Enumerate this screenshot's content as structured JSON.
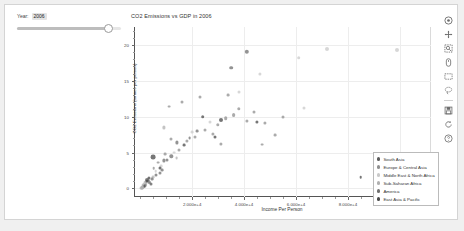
{
  "app": {
    "background": "#f0f0f0",
    "panel_background": "#ffffff"
  },
  "slider": {
    "label_prefix": "Year:",
    "value": "2006",
    "min": 1960,
    "max": 2010,
    "handle_percent": 88,
    "name": "year-slider"
  },
  "plot": {
    "title": "CO2 Emissions vs GDP in 2006",
    "xlabel": "Income Per Person",
    "ylabel": "CO2 Emissions (tonnes per person)"
  },
  "axes": {
    "x_ticks": [
      {
        "label": "2.000e+4",
        "value": 20000
      },
      {
        "label": "4.000e+4",
        "value": 40000
      },
      {
        "label": "6.000e+4",
        "value": 60000
      },
      {
        "label": "8.000e+4",
        "value": 80000
      },
      {
        "label": "1.000e+5",
        "value": 100000
      }
    ],
    "y_ticks": [
      {
        "label": "20",
        "value": 20
      },
      {
        "label": "15",
        "value": 15
      },
      {
        "label": "10",
        "value": 10
      },
      {
        "label": "5",
        "value": 5
      },
      {
        "label": "0",
        "value": 0
      }
    ],
    "xlim": [
      -2000,
      112000
    ],
    "ylim": [
      -1.2,
      22.5
    ],
    "grid": true
  },
  "legend": {
    "position": "bottom-right",
    "items": [
      {
        "label": "South Asia",
        "color": "#5b5b5b"
      },
      {
        "label": "Europe & Central Asia",
        "color": "#8f8f8f"
      },
      {
        "label": "Middle East & North Africa",
        "color": "#c9c9c9"
      },
      {
        "label": "Sub-Saharan Africa",
        "color": "#b0b0b0"
      },
      {
        "label": "America",
        "color": "#6f6f6f"
      },
      {
        "label": "East Asia & Pacific",
        "color": "#484848"
      }
    ]
  },
  "toolbar": {
    "items": [
      {
        "name": "bokeh-logo-icon",
        "label": "Bokeh"
      },
      {
        "name": "pan-tool-icon",
        "label": "Pan"
      },
      {
        "name": "box-zoom-tool-icon",
        "label": "Box Zoom"
      },
      {
        "name": "wheel-zoom-tool-icon",
        "label": "Wheel Zoom"
      },
      {
        "name": "box-select-tool-icon",
        "label": "Box Select"
      },
      {
        "name": "lasso-select-tool-icon",
        "label": "Lasso Select"
      },
      {
        "name": "save-tool-icon",
        "label": "Save"
      },
      {
        "name": "reset-tool-icon",
        "label": "Reset"
      },
      {
        "name": "help-tool-icon",
        "label": "Help"
      }
    ]
  },
  "chart_data": {
    "type": "scatter",
    "title": "CO2 Emissions vs GDP in 2006",
    "xlabel": "Income Per Person",
    "ylabel": "CO2 Emissions (tonnes per person)",
    "xlim": [
      -2000,
      112000
    ],
    "ylim": [
      -1.2,
      22.5
    ],
    "grid": true,
    "legend_position": "bottom-right",
    "series": [
      {
        "name": "South Asia",
        "color": "#5b5b5b",
        "points": [
          {
            "x": 2600,
            "y": 1.2,
            "r": 2.0
          },
          {
            "x": 1400,
            "y": 0.3,
            "r": 1.6
          },
          {
            "x": 4100,
            "y": 0.6,
            "r": 1.5
          },
          {
            "x": 2100,
            "y": 0.5,
            "r": 1.4
          },
          {
            "x": 3400,
            "y": 0.9,
            "r": 1.3
          },
          {
            "x": 1100,
            "y": 0.2,
            "r": 1.2
          }
        ]
      },
      {
        "name": "Europe & Central Asia",
        "color": "#8f8f8f",
        "points": [
          {
            "x": 33000,
            "y": 9.8,
            "r": 1.8
          },
          {
            "x": 36000,
            "y": 10.2,
            "r": 1.9
          },
          {
            "x": 30000,
            "y": 8.9,
            "r": 1.7
          },
          {
            "x": 41000,
            "y": 9.4,
            "r": 1.6
          },
          {
            "x": 28000,
            "y": 7.6,
            "r": 1.6
          },
          {
            "x": 25000,
            "y": 8.2,
            "r": 1.5
          },
          {
            "x": 38000,
            "y": 11.1,
            "r": 1.7
          },
          {
            "x": 44000,
            "y": 10.6,
            "r": 1.5
          },
          {
            "x": 31000,
            "y": 6.2,
            "r": 1.6
          },
          {
            "x": 21000,
            "y": 7.1,
            "r": 1.5
          },
          {
            "x": 18000,
            "y": 6.6,
            "r": 1.6
          },
          {
            "x": 15000,
            "y": 5.4,
            "r": 1.5
          },
          {
            "x": 12000,
            "y": 6.9,
            "r": 1.5
          },
          {
            "x": 9500,
            "y": 4.8,
            "r": 1.4
          },
          {
            "x": 48000,
            "y": 9.1,
            "r": 1.6
          },
          {
            "x": 55000,
            "y": 9.9,
            "r": 1.5
          },
          {
            "x": 23000,
            "y": 12.8,
            "r": 1.5
          },
          {
            "x": 16000,
            "y": 12.0,
            "r": 1.5
          },
          {
            "x": 11000,
            "y": 11.4,
            "r": 1.4
          },
          {
            "x": 34000,
            "y": 13.0,
            "r": 1.4
          },
          {
            "x": 7000,
            "y": 3.6,
            "r": 1.4
          },
          {
            "x": 5200,
            "y": 2.8,
            "r": 1.3
          },
          {
            "x": 47000,
            "y": 6.1,
            "r": 1.4
          },
          {
            "x": 52000,
            "y": 7.4,
            "r": 1.4
          }
        ]
      },
      {
        "name": "Middle East & North Africa",
        "color": "#c9c9c9",
        "points": [
          {
            "x": 72000,
            "y": 19.5,
            "r": 2.0
          },
          {
            "x": 61000,
            "y": 18.2,
            "r": 1.8
          },
          {
            "x": 99000,
            "y": 19.3,
            "r": 2.0
          },
          {
            "x": 46000,
            "y": 16.0,
            "r": 1.6
          },
          {
            "x": 38000,
            "y": 13.4,
            "r": 1.5
          },
          {
            "x": 27000,
            "y": 9.2,
            "r": 1.5
          },
          {
            "x": 13000,
            "y": 5.0,
            "r": 1.4
          },
          {
            "x": 8000,
            "y": 3.1,
            "r": 1.4
          },
          {
            "x": 6000,
            "y": 2.4,
            "r": 1.3
          },
          {
            "x": 20000,
            "y": 7.8,
            "r": 1.4
          },
          {
            "x": 63000,
            "y": 11.2,
            "r": 1.5
          }
        ]
      },
      {
        "name": "Sub-Saharan Africa",
        "color": "#b0b0b0",
        "points": [
          {
            "x": 900,
            "y": 0.15,
            "r": 1.8
          },
          {
            "x": 1200,
            "y": 0.25,
            "r": 1.7
          },
          {
            "x": 700,
            "y": 0.1,
            "r": 1.6
          },
          {
            "x": 1800,
            "y": 0.4,
            "r": 1.5
          },
          {
            "x": 2400,
            "y": 0.7,
            "r": 1.5
          },
          {
            "x": 600,
            "y": 0.08,
            "r": 1.5
          },
          {
            "x": 3200,
            "y": 1.0,
            "r": 1.4
          },
          {
            "x": 1500,
            "y": 0.3,
            "r": 1.4
          },
          {
            "x": 5000,
            "y": 1.6,
            "r": 1.4
          },
          {
            "x": 9000,
            "y": 8.5,
            "r": 1.6
          },
          {
            "x": 1000,
            "y": 0.5,
            "r": 1.3
          },
          {
            "x": 800,
            "y": 0.2,
            "r": 1.3
          },
          {
            "x": 2000,
            "y": 0.9,
            "r": 1.3
          },
          {
            "x": 1300,
            "y": 0.6,
            "r": 1.3
          },
          {
            "x": 500,
            "y": 0.05,
            "r": 1.4
          },
          {
            "x": 14000,
            "y": 4.2,
            "r": 1.4
          }
        ]
      },
      {
        "name": "America",
        "color": "#6f6f6f",
        "points": [
          {
            "x": 41000,
            "y": 19.0,
            "r": 2.2
          },
          {
            "x": 35000,
            "y": 16.8,
            "r": 1.8
          },
          {
            "x": 12000,
            "y": 4.5,
            "r": 1.7
          },
          {
            "x": 9000,
            "y": 3.9,
            "r": 1.6
          },
          {
            "x": 14000,
            "y": 6.4,
            "r": 1.6
          },
          {
            "x": 7500,
            "y": 2.1,
            "r": 1.5
          },
          {
            "x": 6200,
            "y": 1.8,
            "r": 1.5
          },
          {
            "x": 10500,
            "y": 4.0,
            "r": 1.5
          },
          {
            "x": 4500,
            "y": 1.3,
            "r": 1.4
          },
          {
            "x": 19000,
            "y": 7.0,
            "r": 1.4
          },
          {
            "x": 8500,
            "y": 2.6,
            "r": 1.4
          },
          {
            "x": 3000,
            "y": 1.1,
            "r": 1.4
          },
          {
            "x": 22000,
            "y": 8.0,
            "r": 1.4
          }
        ]
      },
      {
        "name": "East Asia & Pacific",
        "color": "#484848",
        "points": [
          {
            "x": 31000,
            "y": 9.6,
            "r": 2.0
          },
          {
            "x": 5000,
            "y": 4.4,
            "r": 2.4
          },
          {
            "x": 24000,
            "y": 10.0,
            "r": 1.8
          },
          {
            "x": 45000,
            "y": 9.3,
            "r": 1.6
          },
          {
            "x": 3500,
            "y": 1.5,
            "r": 1.6
          },
          {
            "x": 2800,
            "y": 1.0,
            "r": 1.5
          },
          {
            "x": 7800,
            "y": 2.9,
            "r": 1.5
          },
          {
            "x": 1700,
            "y": 0.35,
            "r": 1.4
          },
          {
            "x": 29000,
            "y": 7.2,
            "r": 1.5
          },
          {
            "x": 17000,
            "y": 6.0,
            "r": 1.4
          },
          {
            "x": 105000,
            "y": 1.4,
            "r": 1.4
          },
          {
            "x": 85000,
            "y": 1.6,
            "r": 1.3
          }
        ]
      }
    ]
  }
}
